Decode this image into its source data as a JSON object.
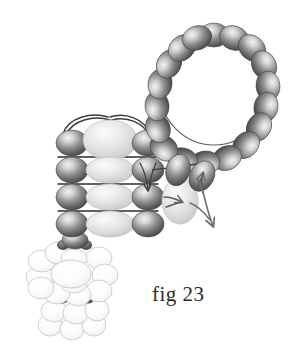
{
  "figure": {
    "caption": "fig 23",
    "background_color": "#ffffff",
    "width": 302,
    "height": 349
  },
  "palette": {
    "dark_bead_edge": "#4a4a4a",
    "dark_bead_mid": "#8a8a8a",
    "dark_bead_highlight": "#e8e8e8",
    "light_bead_edge": "#b9b9b9",
    "light_bead_mid": "#d6d6d6",
    "light_bead_highlight": "#f4f4f4",
    "white_bead_edge": "#b0b0b0",
    "white_bead_mid": "#f2f2f2",
    "white_bead_highlight": "#ffffff",
    "thread_color": "#3c3c3c",
    "arrow_color": "#6e6e6e",
    "caption_color": "#2b2b2b"
  },
  "components": {
    "bead_loop": {
      "name": "bead-loop-ring",
      "bead_count": 16,
      "bead_color": "dark",
      "center_x": 214,
      "center_y": 90,
      "radius_x": 54,
      "radius_y": 55,
      "bead_rx": 15,
      "bead_ry": 12
    },
    "woven_grid": {
      "name": "woven-bead-grid",
      "rows": 4,
      "left_column_color": "dark",
      "center_column_color": "light",
      "right_column_color": "dark",
      "row_thread_lines": 3,
      "top_arcs": 2,
      "origin_x": 62,
      "origin_y": 130,
      "row_spacing": 27
    },
    "connector_chain": {
      "name": "connector-bead-chain",
      "bead_count": 4,
      "bead_color": "dark",
      "start_x": 176,
      "start_y": 168
    },
    "accent_bead": {
      "name": "accent-light-bead",
      "color": "light",
      "center_x": 180,
      "center_y": 200,
      "rx": 17,
      "ry": 22
    },
    "flower_cluster": {
      "name": "flower-bead-cluster",
      "petal_count": 10,
      "bead_color": "white",
      "center_x": 72,
      "center_y": 282,
      "spacer_beads": 2,
      "spacer_color": "dark"
    }
  },
  "annotations": {
    "arrows": [
      {
        "name": "needle-arrow-down-through-grid",
        "direction": "down",
        "description": "thread passing down through right column bead"
      },
      {
        "name": "needle-arrow-right-into-accent-bead",
        "direction": "right",
        "description": "thread entering accent bead"
      },
      {
        "name": "needle-arrow-up-connector",
        "direction": "up",
        "description": "thread exiting connector chain upward"
      },
      {
        "name": "needle-arrow-curve-down-right",
        "direction": "down-right",
        "description": "thread curving away to lower right"
      }
    ]
  }
}
